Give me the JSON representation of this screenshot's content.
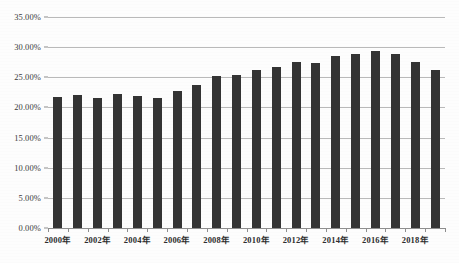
{
  "chart_data": {
    "type": "bar",
    "title": "",
    "xlabel": "",
    "ylabel": "",
    "ylim": [
      0,
      35
    ],
    "ytick_values": [
      0,
      5,
      10,
      15,
      20,
      25,
      30,
      35
    ],
    "ytick_labels": [
      "0.00%",
      "5.00%",
      "10.00%",
      "15.00%",
      "20.00%",
      "25.00%",
      "30.00%",
      "35.00%"
    ],
    "grid": true,
    "legend": "none",
    "bar_color": "#343434",
    "grid_color": "#b9b9b9",
    "axis_color": "#8d8d8d",
    "categories": [
      "2000年",
      "2001年",
      "2002年",
      "2003年",
      "2004年",
      "2005年",
      "2006年",
      "2007年",
      "2008年",
      "2009年",
      "2010年",
      "2011年",
      "2012年",
      "2013年",
      "2014年",
      "2015年",
      "2016年",
      "2017年",
      "2018年",
      "2019年"
    ],
    "xtick_labels_shown": [
      "2000年",
      "2002年",
      "2004年",
      "2006年",
      "2008年",
      "2010年",
      "2012年",
      "2014年",
      "2016年",
      "2018年"
    ],
    "values": [
      21.8,
      22.0,
      21.6,
      22.2,
      21.9,
      21.5,
      22.7,
      23.8,
      25.2,
      25.3,
      26.2,
      26.7,
      27.6,
      27.4,
      28.5,
      28.8,
      29.3,
      28.8,
      27.5,
      26.2
    ]
  }
}
